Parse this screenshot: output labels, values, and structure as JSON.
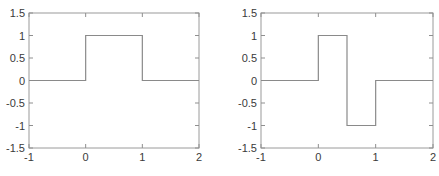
{
  "figure": {
    "background": "#ffffff"
  },
  "colors": {
    "signal_line": "#8a8a8a",
    "axis_box": "#9a9a9a",
    "tick_mark": "#8f8f8f",
    "tick_text": "#3a3a3a"
  },
  "chart_data": [
    {
      "type": "line",
      "name": "scaling-function",
      "title": "",
      "xlabel": "",
      "ylabel": "",
      "xlim": [
        -1,
        2
      ],
      "ylim": [
        -1.5,
        1.5
      ],
      "xticks": [
        -1,
        0,
        1,
        2
      ],
      "yticks": [
        -1.5,
        -1,
        -0.5,
        0,
        0.5,
        1,
        1.5
      ],
      "xtick_labels": [
        "-1",
        "0",
        "1",
        "2"
      ],
      "ytick_labels": [
        "-1.5",
        "-1",
        "-0.5",
        "0",
        "0.5",
        "1",
        "1.5"
      ],
      "grid": false,
      "box": true,
      "legend": null,
      "series": [
        {
          "name": "boxcar-pulse",
          "x": [
            -1,
            0,
            0,
            1,
            1,
            2
          ],
          "y": [
            0,
            0,
            1,
            1,
            0,
            0
          ]
        }
      ]
    },
    {
      "type": "line",
      "name": "haar-wavelet",
      "title": "",
      "xlabel": "",
      "ylabel": "",
      "xlim": [
        -1,
        2
      ],
      "ylim": [
        -1.5,
        1.5
      ],
      "xticks": [
        -1,
        0,
        1,
        2
      ],
      "yticks": [
        -1.5,
        -1,
        -0.5,
        0,
        0.5,
        1,
        1.5
      ],
      "xtick_labels": [
        "-1",
        "0",
        "1",
        "2"
      ],
      "ytick_labels": [
        "-1.5",
        "-1",
        "-0.5",
        "0",
        "0.5",
        "1",
        "1.5"
      ],
      "grid": false,
      "box": true,
      "legend": null,
      "series": [
        {
          "name": "haar-pulse",
          "x": [
            -1,
            0,
            0,
            0.5,
            0.5,
            1,
            1,
            2
          ],
          "y": [
            0,
            0,
            1,
            1,
            -1,
            -1,
            0,
            0
          ]
        }
      ]
    }
  ]
}
